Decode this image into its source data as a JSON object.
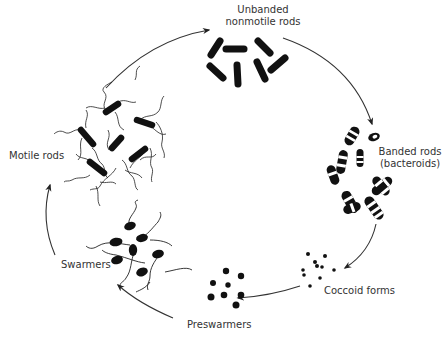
{
  "diagram": {
    "type": "life-cycle",
    "colors": {
      "ink": "#111111",
      "arrow": "#333333",
      "label": "#333333",
      "background": "#ffffff"
    },
    "stages": [
      {
        "id": "unbanded",
        "label_line1": "Unbanded",
        "label_line2": "nonmotile rods"
      },
      {
        "id": "banded",
        "label_line1": "Banded rods",
        "label_line2": "(bacteroids)"
      },
      {
        "id": "coccoid",
        "label_line1": "Coccoid forms"
      },
      {
        "id": "preswarmers",
        "label_line1": "Preswarmers"
      },
      {
        "id": "swarmers",
        "label_line1": "Swarmers"
      },
      {
        "id": "motile",
        "label_line1": "Motile rods"
      }
    ],
    "flow": [
      "unbanded",
      "banded",
      "coccoid",
      "preswarmers",
      "swarmers",
      "motile",
      "unbanded"
    ]
  }
}
